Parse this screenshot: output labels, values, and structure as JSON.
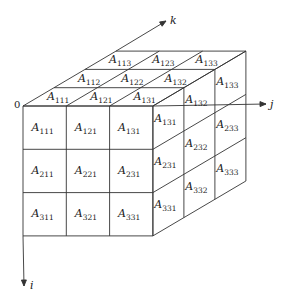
{
  "figure": {
    "type": "3D array index diagram",
    "origin_label": "0",
    "axes": {
      "i": {
        "label": "i",
        "direction": "down"
      },
      "j": {
        "label": "j",
        "direction": "right"
      },
      "k": {
        "label": "k",
        "direction": "depth"
      }
    },
    "front_face": {
      "cells": [
        [
          "A111",
          "A121",
          "A131"
        ],
        [
          "A211",
          "A221",
          "A231"
        ],
        [
          "A311",
          "A321",
          "A331"
        ]
      ]
    },
    "top_face": {
      "rows_back_to_front": [
        [
          "A113",
          "A123",
          "A133"
        ],
        [
          "A112",
          "A122",
          "A132"
        ],
        [
          "A111",
          "A121",
          "A131"
        ]
      ]
    },
    "right_face": {
      "columns_front_to_back": [
        [
          "A131",
          "A231",
          "A331"
        ],
        [
          "A132",
          "A232",
          "A332"
        ],
        [
          "A133",
          "A233",
          "A333"
        ]
      ]
    },
    "colors": {
      "line": "#333333",
      "background": "#ffffff"
    }
  }
}
